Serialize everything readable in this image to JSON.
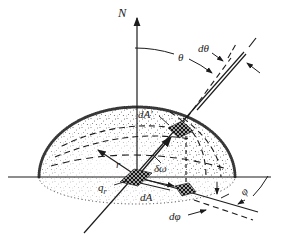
{
  "figure": {
    "type": "diagram",
    "colors": {
      "ink": "#1c1c1c",
      "background": "#ffffff"
    },
    "labels": {
      "normal_axis": "N",
      "polar_angle": "θ",
      "polar_angle_increment": "dθ",
      "hemisphere_area_element": "dA′",
      "solid_angle": "δω",
      "radius": "r",
      "radiant_flux_base": "q",
      "radiant_flux_subscript": "r",
      "base_area_element": "dA",
      "azimuthal_angle_increment": "dφ",
      "azimuthal_angle": "φ"
    }
  }
}
